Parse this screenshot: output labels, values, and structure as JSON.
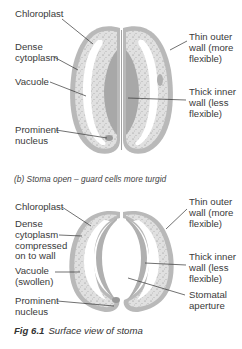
{
  "diagram_a": {
    "labels_left": [
      "Chloroplast",
      "Dense\ncytoplasm",
      "Vacuole",
      "Prominent\nnucleus"
    ],
    "labels_right": [
      "Thin outer\nwall (more\nflexible)",
      "Thick inner\nwall (less\nflexible)"
    ]
  },
  "diagram_b": {
    "caption": "(b) Stoma open – guard cells more turgid",
    "labels_left": [
      "Chloroplast",
      "Dense\ncytoplasm\ncompressed\non to wall",
      "Vacuole\n(swollen)",
      "Prominent\nnucleus"
    ],
    "labels_right": [
      "Thin outer\nwall (more\nflexible)",
      "Thick inner\nwall (less\nflexible)",
      "Stomatal\naperture"
    ]
  },
  "figure": {
    "number": "Fig 6.1",
    "title": "Surface view of stoma"
  },
  "colors": {
    "wall": "#b9b9b9",
    "cytoplasm": "#dedede",
    "inner_wall": "#a9a9a9",
    "vacuole": "#ffffff",
    "leader": "#333333"
  }
}
